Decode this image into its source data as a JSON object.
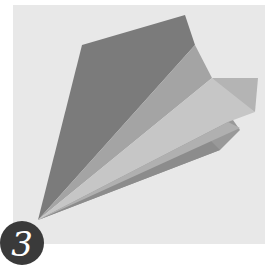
{
  "step": {
    "number": "3"
  },
  "illustration": {
    "subject": "paper-airplane",
    "colors": {
      "background_panel": "#e8e8e8",
      "wing_dark": "#7b7b7b",
      "wing_mid": "#a4a4a4",
      "wing_light": "#c6c6c6",
      "wing_tip": "#b4b4b4",
      "underside": "#999999",
      "badge": "#3a3a3a"
    }
  }
}
